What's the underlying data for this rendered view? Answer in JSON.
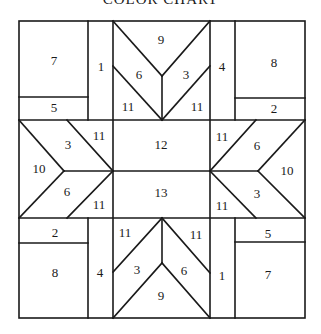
{
  "title": "COLOR CHART",
  "colors": {
    "line": "#1a1a1a",
    "background": "#ffffff"
  },
  "pieces": {
    "tl_square": "7",
    "tl_strip": "5",
    "tl_column": "1",
    "top_tip": "9",
    "top_left_arm": "6",
    "top_right_arm": "3",
    "top_left_corner": "11",
    "top_right_corner": "11",
    "tr_column": "4",
    "tr_square": "8",
    "tr_strip": "2",
    "left_tip": "10",
    "left_upper_arm": "3",
    "left_lower_arm": "6",
    "left_upper_corner": "11",
    "left_lower_corner": "11",
    "center_top": "12",
    "center_bottom": "13",
    "right_tip": "10",
    "right_upper_arm": "6",
    "right_lower_arm": "3",
    "right_upper_corner": "11",
    "right_lower_corner": "11",
    "bl_strip": "2",
    "bl_square": "8",
    "bl_column": "4",
    "bottom_tip": "9",
    "bottom_left_arm": "3",
    "bottom_right_arm": "6",
    "bottom_left_corner": "11",
    "bottom_right_corner": "11",
    "br_column": "1",
    "br_strip": "5",
    "br_square": "7"
  }
}
